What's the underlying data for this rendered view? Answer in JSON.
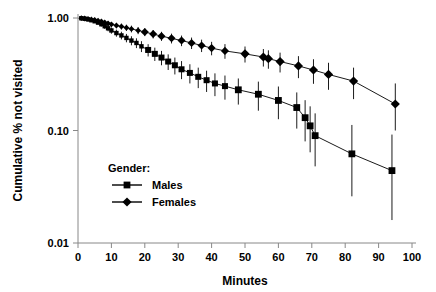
{
  "chart_data": {
    "type": "line",
    "title": "",
    "xlabel": "Minutes",
    "ylabel": "Cumulative % not visited",
    "xlim": [
      0,
      100
    ],
    "ylim": [
      0.01,
      1.0
    ],
    "yscale": "log",
    "xticks": [
      0,
      10,
      20,
      30,
      40,
      50,
      60,
      70,
      80,
      90,
      100
    ],
    "xticklabels": [
      "0",
      "10",
      "20",
      "30",
      "40",
      "50",
      "60",
      "70",
      "80",
      "90",
      "100"
    ],
    "yticks": [
      0.01,
      0.1,
      1.0
    ],
    "yticklabels": [
      "0.01",
      "0.10",
      "1.00"
    ],
    "grid": false,
    "legend_position": "lower-left-inside",
    "legend_title": "Gender:",
    "error_bars": true,
    "series": [
      {
        "name": "Males",
        "marker": "square",
        "color": "#000000",
        "points": [
          {
            "x": 1.0,
            "y": 0.995,
            "lo": 0.985,
            "hi": 1.0
          },
          {
            "x": 2.0,
            "y": 0.985,
            "lo": 0.97,
            "hi": 0.999
          },
          {
            "x": 3.0,
            "y": 0.972,
            "lo": 0.952,
            "hi": 0.992
          },
          {
            "x": 4.0,
            "y": 0.955,
            "lo": 0.93,
            "hi": 0.98
          },
          {
            "x": 5.0,
            "y": 0.935,
            "lo": 0.905,
            "hi": 0.965
          },
          {
            "x": 6.0,
            "y": 0.91,
            "lo": 0.875,
            "hi": 0.945
          },
          {
            "x": 7.0,
            "y": 0.88,
            "lo": 0.84,
            "hi": 0.92
          },
          {
            "x": 8.0,
            "y": 0.845,
            "lo": 0.8,
            "hi": 0.89
          },
          {
            "x": 9.0,
            "y": 0.81,
            "lo": 0.762,
            "hi": 0.858
          },
          {
            "x": 10.0,
            "y": 0.775,
            "lo": 0.725,
            "hi": 0.825
          },
          {
            "x": 11.5,
            "y": 0.735,
            "lo": 0.682,
            "hi": 0.788
          },
          {
            "x": 13.0,
            "y": 0.7,
            "lo": 0.645,
            "hi": 0.755
          },
          {
            "x": 14.5,
            "y": 0.665,
            "lo": 0.608,
            "hi": 0.722
          },
          {
            "x": 16.0,
            "y": 0.63,
            "lo": 0.572,
            "hi": 0.688
          },
          {
            "x": 17.5,
            "y": 0.6,
            "lo": 0.54,
            "hi": 0.66
          },
          {
            "x": 19.0,
            "y": 0.56,
            "lo": 0.498,
            "hi": 0.622
          },
          {
            "x": 21.0,
            "y": 0.52,
            "lo": 0.455,
            "hi": 0.585
          },
          {
            "x": 23.0,
            "y": 0.48,
            "lo": 0.415,
            "hi": 0.545
          },
          {
            "x": 25.0,
            "y": 0.445,
            "lo": 0.38,
            "hi": 0.51
          },
          {
            "x": 27.0,
            "y": 0.41,
            "lo": 0.345,
            "hi": 0.475
          },
          {
            "x": 29.0,
            "y": 0.38,
            "lo": 0.315,
            "hi": 0.445
          },
          {
            "x": 31.0,
            "y": 0.35,
            "lo": 0.286,
            "hi": 0.414
          },
          {
            "x": 33.5,
            "y": 0.325,
            "lo": 0.262,
            "hi": 0.388
          },
          {
            "x": 36.0,
            "y": 0.3,
            "lo": 0.238,
            "hi": 0.362
          },
          {
            "x": 38.5,
            "y": 0.28,
            "lo": 0.22,
            "hi": 0.34
          },
          {
            "x": 41.0,
            "y": 0.262,
            "lo": 0.202,
            "hi": 0.322
          },
          {
            "x": 44.0,
            "y": 0.248,
            "lo": 0.188,
            "hi": 0.308
          },
          {
            "x": 48.0,
            "y": 0.23,
            "lo": 0.17,
            "hi": 0.29
          },
          {
            "x": 54.0,
            "y": 0.21,
            "lo": 0.15,
            "hi": 0.272
          },
          {
            "x": 60.0,
            "y": 0.185,
            "lo": 0.126,
            "hi": 0.246
          },
          {
            "x": 65.5,
            "y": 0.16,
            "lo": 0.104,
            "hi": 0.218
          },
          {
            "x": 68.0,
            "y": 0.13,
            "lo": 0.08,
            "hi": 0.186
          },
          {
            "x": 69.5,
            "y": 0.11,
            "lo": 0.064,
            "hi": 0.164
          },
          {
            "x": 71.0,
            "y": 0.09,
            "lo": 0.048,
            "hi": 0.142
          },
          {
            "x": 82.0,
            "y": 0.062,
            "lo": 0.026,
            "hi": 0.112
          },
          {
            "x": 94.0,
            "y": 0.044,
            "lo": 0.016,
            "hi": 0.092
          }
        ]
      },
      {
        "name": "Females",
        "marker": "diamond",
        "color": "#000000",
        "points": [
          {
            "x": 1.0,
            "y": 0.997,
            "lo": 0.99,
            "hi": 1.0
          },
          {
            "x": 2.0,
            "y": 0.99,
            "lo": 0.978,
            "hi": 1.0
          },
          {
            "x": 3.0,
            "y": 0.982,
            "lo": 0.966,
            "hi": 0.998
          },
          {
            "x": 4.0,
            "y": 0.972,
            "lo": 0.952,
            "hi": 0.992
          },
          {
            "x": 5.0,
            "y": 0.96,
            "lo": 0.936,
            "hi": 0.984
          },
          {
            "x": 6.0,
            "y": 0.946,
            "lo": 0.918,
            "hi": 0.974
          },
          {
            "x": 7.0,
            "y": 0.93,
            "lo": 0.898,
            "hi": 0.962
          },
          {
            "x": 8.0,
            "y": 0.912,
            "lo": 0.876,
            "hi": 0.948
          },
          {
            "x": 9.0,
            "y": 0.895,
            "lo": 0.856,
            "hi": 0.934
          },
          {
            "x": 10.0,
            "y": 0.878,
            "lo": 0.836,
            "hi": 0.92
          },
          {
            "x": 11.5,
            "y": 0.858,
            "lo": 0.812,
            "hi": 0.904
          },
          {
            "x": 13.0,
            "y": 0.84,
            "lo": 0.79,
            "hi": 0.89
          },
          {
            "x": 14.5,
            "y": 0.82,
            "lo": 0.768,
            "hi": 0.872
          },
          {
            "x": 16.0,
            "y": 0.8,
            "lo": 0.745,
            "hi": 0.855
          },
          {
            "x": 18.0,
            "y": 0.775,
            "lo": 0.718,
            "hi": 0.832
          },
          {
            "x": 20.0,
            "y": 0.75,
            "lo": 0.69,
            "hi": 0.81
          },
          {
            "x": 22.5,
            "y": 0.72,
            "lo": 0.658,
            "hi": 0.782
          },
          {
            "x": 25.0,
            "y": 0.69,
            "lo": 0.626,
            "hi": 0.754
          },
          {
            "x": 28.0,
            "y": 0.66,
            "lo": 0.594,
            "hi": 0.726
          },
          {
            "x": 31.0,
            "y": 0.63,
            "lo": 0.562,
            "hi": 0.698
          },
          {
            "x": 34.0,
            "y": 0.6,
            "lo": 0.53,
            "hi": 0.67
          },
          {
            "x": 37.0,
            "y": 0.57,
            "lo": 0.498,
            "hi": 0.642
          },
          {
            "x": 40.0,
            "y": 0.54,
            "lo": 0.466,
            "hi": 0.614
          },
          {
            "x": 44.0,
            "y": 0.51,
            "lo": 0.434,
            "hi": 0.586
          },
          {
            "x": 50.0,
            "y": 0.48,
            "lo": 0.402,
            "hi": 0.558
          },
          {
            "x": 55.5,
            "y": 0.45,
            "lo": 0.37,
            "hi": 0.53
          },
          {
            "x": 57.0,
            "y": 0.435,
            "lo": 0.354,
            "hi": 0.516
          },
          {
            "x": 60.5,
            "y": 0.41,
            "lo": 0.328,
            "hi": 0.492
          },
          {
            "x": 66.0,
            "y": 0.375,
            "lo": 0.292,
            "hi": 0.458
          },
          {
            "x": 70.5,
            "y": 0.345,
            "lo": 0.26,
            "hi": 0.43
          },
          {
            "x": 75.0,
            "y": 0.315,
            "lo": 0.23,
            "hi": 0.4
          },
          {
            "x": 82.5,
            "y": 0.275,
            "lo": 0.19,
            "hi": 0.362
          },
          {
            "x": 95.0,
            "y": 0.172,
            "lo": 0.1,
            "hi": 0.262
          }
        ]
      }
    ]
  }
}
